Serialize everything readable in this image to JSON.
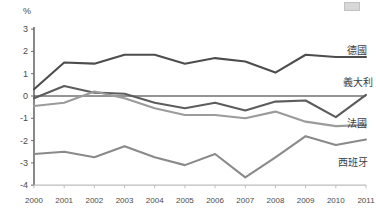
{
  "chart_data": {
    "type": "line",
    "title": "",
    "subtitle": "",
    "xlabel": "",
    "ylabel": "%",
    "unit_label": "%",
    "categories": [
      "2000",
      "2001",
      "2002",
      "2003",
      "2004",
      "2005",
      "2006",
      "2007",
      "2008",
      "2009",
      "2010",
      "2011"
    ],
    "x": [
      2000,
      2001,
      2002,
      2003,
      2004,
      2005,
      2006,
      2007,
      2008,
      2009,
      2010,
      2011
    ],
    "ylim": [
      -4,
      3
    ],
    "yticks": [
      "3",
      "2",
      "1",
      "0",
      "-1",
      "-2",
      "-3",
      "-4"
    ],
    "ytick_values": [
      3,
      2,
      1,
      0,
      -1,
      -2,
      -3,
      -4
    ],
    "grid": false,
    "zero_line": true,
    "legend_position": "right-inline",
    "series": [
      {
        "name": "德國",
        "color": "#4d4d4d",
        "label_x": 347,
        "label_y": 45,
        "values": [
          0.3,
          1.5,
          1.45,
          1.85,
          1.85,
          1.45,
          1.7,
          1.55,
          1.05,
          1.85,
          1.75,
          1.75
        ]
      },
      {
        "name": "義大利",
        "color": "#5c5c5c",
        "label_x": 343,
        "label_y": 77,
        "values": [
          -0.1,
          0.45,
          0.15,
          0.1,
          -0.3,
          -0.55,
          -0.3,
          -0.65,
          -0.25,
          -0.2,
          -0.95,
          0.05
        ]
      },
      {
        "name": "法國",
        "color": "#9b9b9b",
        "label_x": 347,
        "label_y": 118,
        "values": [
          -0.45,
          -0.3,
          0.2,
          -0.1,
          -0.55,
          -0.85,
          -0.85,
          -1.0,
          -0.7,
          -1.15,
          -1.35,
          -1.3
        ]
      },
      {
        "name": "西班牙",
        "color": "#8a8a8a",
        "label_x": 338,
        "label_y": 157,
        "values": [
          -2.6,
          -2.5,
          -2.75,
          -2.25,
          -2.75,
          -3.1,
          -2.6,
          -3.65,
          -2.75,
          -1.8,
          -2.2,
          -1.95
        ]
      }
    ],
    "colors": {
      "axis": "#6b6b6b",
      "zero_line": "#2b2b2b",
      "germany": "#4d4d4d",
      "italy": "#5c5c5c",
      "france": "#9b9b9b",
      "spain": "#8a8a8a",
      "text": "#4a4a4a"
    }
  }
}
